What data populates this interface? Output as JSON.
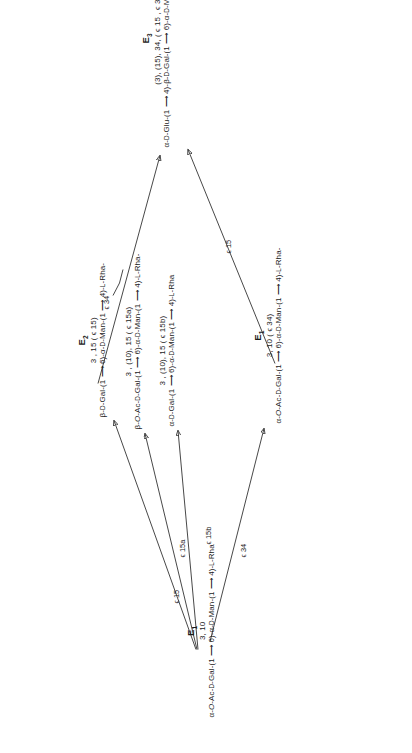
{
  "diagram": {
    "type": "reaction-scheme",
    "orientation": "rotated-90-ccw",
    "nodes": {
      "e1_bottom": {
        "label": "E",
        "sub": "1",
        "superscript": "3, 10",
        "formula": "α-O-Ac-D-Gal-(1 ⟶ 6)-α-D-Man-(1 ⟶ 4)-L-Rha"
      },
      "e1_right": {
        "label": "E",
        "sub": "1",
        "superscript": "3, 10 ( ϵ 34)",
        "formula": "α-O-Ac-D-Gal-(1 ⟶ 6)-α-D-Man-(1 ⟶ 4)-L-Rha-"
      },
      "e2_a": {
        "label": "E",
        "sub": "2",
        "superscript": "3 , 15 ( ϵ 15)",
        "formula": "β-D-Gal-(1 ⟶ 6)-α-D-Man-(1 ⟶ 4)-L-Rha-"
      },
      "e2_b": {
        "superscript": "3 , (10), 15 ( ϵ 15a)",
        "formula": "β-O-Ac-D-Gal-(1 ⟶ 6)-α-D-Man-(1 ⟶ 4)-L-Rha-"
      },
      "e2_c": {
        "superscript": "3 , (10), 15 ( ϵ 15b)",
        "formula": "α-D-Gal-(1 ⟶ 6)-α-D-Man-(1 ⟶ 4)-L-Rha"
      },
      "e3": {
        "label": "E",
        "sub": "3",
        "superscript": "(3), (15), 34, ( ϵ 15 , ϵ 34)",
        "formula": "α-D-Glu-(1 ⟶ 4)-β-D-Gal-(1 ⟶ 6)-α-D-Man-(1 ⟶ 3)-L-Rha-"
      }
    },
    "arrow_labels": {
      "a_e1_to_e2a": "ϵ 15",
      "a_e1_to_e2b": "ϵ 15a",
      "a_e1_to_e2c": "ϵ 15b",
      "a_e1_to_e1r": "ϵ 34",
      "a_e2_to_e3": "ϵ 34",
      "a_e1r_to_e3": "ϵ 15"
    },
    "colors": {
      "ink": "#1a1a1a",
      "line": "#333333",
      "background": "#ffffff"
    }
  }
}
